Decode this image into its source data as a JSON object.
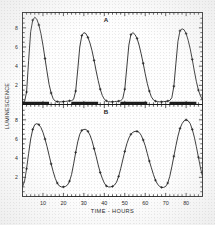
{
  "figure": {
    "xlabel": "TIME - HOURS",
    "ylabel": "LUMINESCENCE",
    "panel_a_label": "A",
    "panel_b_label": "B",
    "ink_color": "#1a1a1a",
    "background_color": "#fefefe"
  },
  "chart_data": [
    {
      "type": "line",
      "title": "A",
      "xlabel": "TIME - HOURS",
      "ylabel": "LUMINESCENCE",
      "xlim": [
        0,
        88
      ],
      "ylim": [
        0,
        9.6
      ],
      "xticks": [
        10,
        20,
        30,
        40,
        50,
        60,
        70,
        80
      ],
      "yticks": [
        2,
        4,
        6,
        8
      ],
      "grid": false,
      "legend": null,
      "markers": "plus",
      "series": [
        {
          "name": "Panel A luminescence",
          "x": [
            0,
            1,
            2,
            3,
            4,
            5,
            6,
            7,
            8,
            9,
            10,
            11,
            12,
            13,
            14,
            15,
            16,
            17,
            18,
            19,
            20,
            21,
            22,
            23,
            24,
            25,
            26,
            27,
            28,
            29,
            30,
            31,
            32,
            33,
            34,
            35,
            36,
            37,
            38,
            39,
            40,
            41,
            42,
            43,
            44,
            45,
            46,
            47,
            48,
            49,
            50,
            51,
            52,
            53,
            54,
            55,
            56,
            57,
            58,
            59,
            60,
            61,
            62,
            63,
            64,
            65,
            66,
            67,
            68,
            69,
            70,
            71,
            72,
            73,
            74,
            75,
            76,
            77,
            78,
            79,
            80,
            81,
            82,
            83,
            84,
            85,
            86,
            87,
            88
          ],
          "y": [
            0.25,
            0.3,
            1.3,
            4.6,
            7.6,
            8.8,
            9.1,
            8.9,
            8.3,
            7.4,
            6.2,
            4.8,
            3.4,
            2.1,
            1.2,
            0.6,
            0.35,
            0.3,
            0.28,
            0.28,
            0.3,
            0.32,
            0.35,
            0.38,
            0.4,
            0.55,
            1.4,
            3.6,
            6.0,
            7.2,
            7.5,
            7.4,
            7.0,
            6.4,
            5.6,
            4.6,
            3.5,
            2.5,
            1.6,
            0.95,
            0.55,
            0.38,
            0.3,
            0.28,
            0.28,
            0.3,
            0.32,
            0.35,
            0.4,
            0.6,
            1.6,
            3.9,
            6.2,
            7.3,
            7.5,
            7.3,
            6.9,
            6.2,
            5.3,
            4.3,
            3.2,
            2.2,
            1.4,
            0.8,
            0.48,
            0.35,
            0.3,
            0.28,
            0.28,
            0.3,
            0.32,
            0.36,
            0.42,
            0.7,
            1.9,
            4.3,
            6.6,
            7.7,
            7.9,
            7.8,
            7.4,
            6.7,
            5.8,
            4.7,
            3.5,
            2.4,
            1.5,
            0.9,
            0.5
          ]
        }
      ],
      "annotations": {
        "dark_bars": [
          {
            "start": 0,
            "end": 13
          },
          {
            "start": 24,
            "end": 37
          },
          {
            "start": 48,
            "end": 61
          },
          {
            "start": 72,
            "end": 85
          }
        ],
        "dark_bar_y": 0.12
      }
    },
    {
      "type": "line",
      "title": "B",
      "xlabel": "TIME - HOURS",
      "ylabel": "LUMINESCENCE",
      "xlim": [
        0,
        88
      ],
      "ylim": [
        0,
        9.6
      ],
      "xticks": [
        10,
        20,
        30,
        40,
        50,
        60,
        70,
        80
      ],
      "yticks": [
        2,
        4,
        6,
        8
      ],
      "grid": false,
      "legend": null,
      "markers": "plus",
      "series": [
        {
          "name": "Panel B luminescence",
          "x": [
            0,
            1,
            2,
            3,
            4,
            5,
            6,
            7,
            8,
            9,
            10,
            11,
            12,
            13,
            14,
            15,
            16,
            17,
            18,
            19,
            20,
            21,
            22,
            23,
            24,
            25,
            26,
            27,
            28,
            29,
            30,
            31,
            32,
            33,
            34,
            35,
            36,
            37,
            38,
            39,
            40,
            41,
            42,
            43,
            44,
            45,
            46,
            47,
            48,
            49,
            50,
            51,
            52,
            53,
            54,
            55,
            56,
            57,
            58,
            59,
            60,
            61,
            62,
            63,
            64,
            65,
            66,
            67,
            68,
            69,
            70,
            71,
            72,
            73,
            74,
            75,
            76,
            77,
            78,
            79,
            80,
            81,
            82,
            83,
            84,
            85,
            86,
            87,
            88
          ],
          "y": [
            1.0,
            1.6,
            2.9,
            4.5,
            6.0,
            7.0,
            7.5,
            7.6,
            7.5,
            7.2,
            6.7,
            6.0,
            5.2,
            4.3,
            3.4,
            2.6,
            1.9,
            1.4,
            1.1,
            1.0,
            1.0,
            1.05,
            1.2,
            1.6,
            2.3,
            3.4,
            4.6,
            5.7,
            6.5,
            6.9,
            7.0,
            7.0,
            6.8,
            6.4,
            5.8,
            5.0,
            4.2,
            3.3,
            2.5,
            1.9,
            1.4,
            1.1,
            1.0,
            1.0,
            1.05,
            1.2,
            1.5,
            2.1,
            2.9,
            3.8,
            4.7,
            5.5,
            6.1,
            6.5,
            6.7,
            6.8,
            6.8,
            6.7,
            6.4,
            5.9,
            5.3,
            4.5,
            3.7,
            3.0,
            2.3,
            1.7,
            1.3,
            1.05,
            0.95,
            0.95,
            1.05,
            1.4,
            2.1,
            3.1,
            4.2,
            5.3,
            6.3,
            7.1,
            7.6,
            7.9,
            8.0,
            7.9,
            7.6,
            7.0,
            6.2,
            5.2,
            4.1,
            3.0,
            2.1
          ]
        }
      ],
      "annotations": {
        "dark_bars": [],
        "dark_bar_y": null
      }
    }
  ]
}
